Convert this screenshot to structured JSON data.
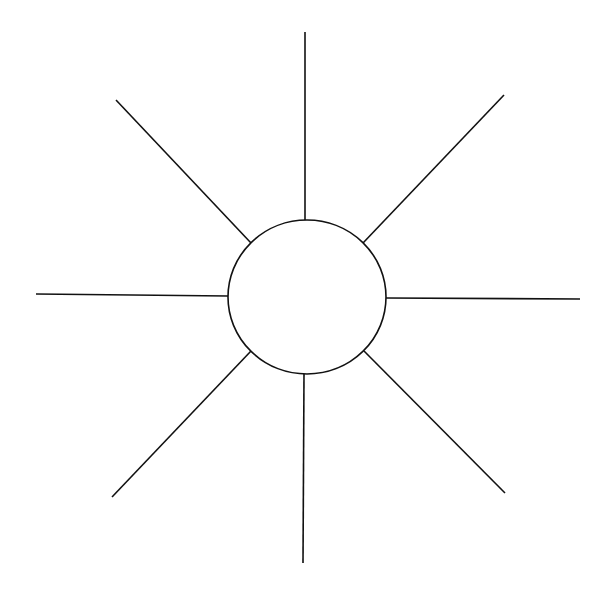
{
  "diagram": {
    "type": "hub-and-spoke",
    "stroke_color": "#111111",
    "background": "#ffffff",
    "hub": {
      "cx": 307,
      "cy": 297,
      "rx": 79,
      "ry": 77,
      "label": ""
    },
    "spokes": [
      {
        "name": "spoke-top",
        "x1": 305,
        "y1": 32,
        "x2": 305,
        "y2": 220,
        "label": ""
      },
      {
        "name": "spoke-top-right",
        "x1": 504,
        "y1": 95,
        "x2": 363,
        "y2": 243,
        "label": ""
      },
      {
        "name": "spoke-right",
        "x1": 580,
        "y1": 299,
        "x2": 386,
        "y2": 298,
        "label": ""
      },
      {
        "name": "spoke-bottom-right",
        "x1": 505,
        "y1": 493,
        "x2": 364,
        "y2": 351,
        "label": ""
      },
      {
        "name": "spoke-bottom",
        "x1": 303,
        "y1": 563,
        "x2": 304,
        "y2": 374,
        "label": ""
      },
      {
        "name": "spoke-bottom-left",
        "x1": 112,
        "y1": 497,
        "x2": 251,
        "y2": 351,
        "label": ""
      },
      {
        "name": "spoke-left",
        "x1": 36,
        "y1": 294,
        "x2": 228,
        "y2": 296,
        "label": ""
      },
      {
        "name": "spoke-top-left",
        "x1": 116,
        "y1": 100,
        "x2": 251,
        "y2": 243,
        "label": ""
      }
    ]
  }
}
